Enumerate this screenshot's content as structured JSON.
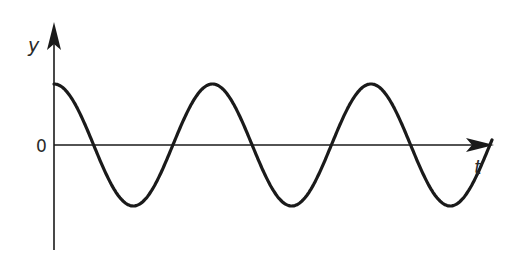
{
  "diagram": {
    "title": "",
    "y_axis_label": "y",
    "x_axis_label": "t",
    "origin_label": "0",
    "line_color": "#1a1a1a"
  },
  "chart_data": {
    "type": "line",
    "title": "",
    "xlabel": "t",
    "ylabel": "y",
    "annotations": [
      "0"
    ],
    "grid": false,
    "legend": null,
    "series": [
      {
        "name": "y(t)",
        "function": "cosine",
        "amplitude": 1,
        "phase": 0,
        "periods_shown": 2.75,
        "peaks_t_periods": [
          0,
          1,
          2
        ],
        "troughs_t_periods": [
          0.5,
          1.5,
          2.5
        ]
      }
    ]
  }
}
